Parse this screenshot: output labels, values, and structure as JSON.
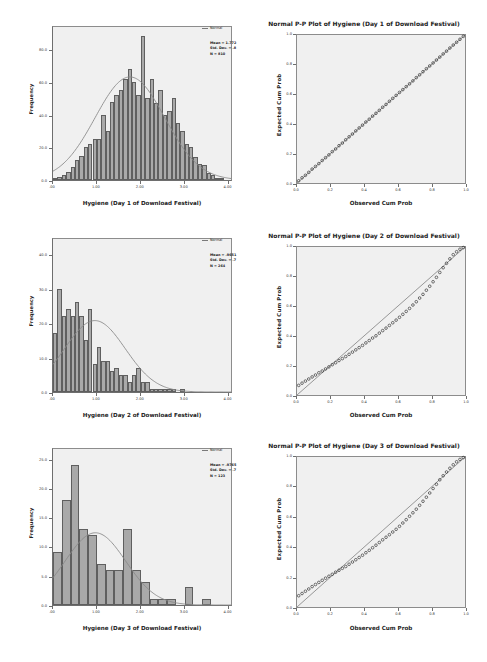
{
  "figure": {
    "background": "#ffffff",
    "panel_fill": "#f0f0f0",
    "bar_fill": "#a9a9a9",
    "bar_stroke": "#5f5f5f",
    "curve_color": "#8a8a8a",
    "point_color": "#1a1a1a",
    "reference_line_color": "#6e6e6e"
  },
  "panels": [
    {
      "id": "hist-day1",
      "legend_label": "Normal",
      "stats": {
        "mean": "Mean = 1.772",
        "std_dev": "Std. Dev. = .8",
        "n": "N = 810"
      },
      "chart_data": {
        "type": "bar",
        "title": "",
        "xlabel": "Hygiene (Day 1 of Download Festival)",
        "ylabel": "Frequency",
        "xlim": [
          0.0,
          4.1
        ],
        "ylim": [
          0,
          95
        ],
        "xticks": [
          ".00",
          "1.00",
          "2.00",
          "3.00",
          "4.00"
        ],
        "xtick_values": [
          0.0,
          1.0,
          2.0,
          3.0,
          4.0
        ],
        "yticks": [
          "0.0",
          "20.0",
          "40.0",
          "60.0",
          "80.0"
        ],
        "ytick_values": [
          0,
          20,
          40,
          60,
          80
        ],
        "grid": false,
        "bin_width": 0.1,
        "bins": [
          0.05,
          0.15,
          0.25,
          0.35,
          0.45,
          0.55,
          0.65,
          0.75,
          0.85,
          0.95,
          1.05,
          1.15,
          1.25,
          1.35,
          1.45,
          1.55,
          1.65,
          1.75,
          1.85,
          1.95,
          2.05,
          2.15,
          2.25,
          2.35,
          2.45,
          2.55,
          2.65,
          2.75,
          2.85,
          2.95,
          3.05,
          3.15,
          3.25,
          3.35,
          3.45,
          3.55,
          3.65,
          3.75,
          3.85
        ],
        "values": [
          1,
          2,
          3,
          5,
          8,
          12,
          15,
          20,
          22,
          25,
          25,
          40,
          30,
          48,
          52,
          55,
          62,
          68,
          60,
          52,
          88,
          50,
          62,
          47,
          55,
          40,
          42,
          50,
          35,
          30,
          22,
          20,
          14,
          10,
          9,
          4,
          3,
          1,
          1
        ],
        "overlay_curve": {
          "name": "Normal",
          "mean": 1.772,
          "sd": 0.8,
          "scale": 64
        }
      }
    },
    {
      "id": "pp-day1",
      "chart_data": {
        "type": "scatter",
        "title": "Normal P-P Plot of Hygiene (Day 1 of Download Festival)",
        "xlabel": "Observed Cum Prob",
        "ylabel": "Expected Cum Prob",
        "xlim": [
          0.0,
          1.0
        ],
        "ylim": [
          0.0,
          1.0
        ],
        "xticks": [
          "0.0",
          "0.2",
          "0.4",
          "0.6",
          "0.8",
          "1.0"
        ],
        "yticks": [
          "0.0",
          "0.2",
          "0.4",
          "0.6",
          "0.8",
          "1.0"
        ],
        "grid": false,
        "reference_line": [
          [
            0,
            0
          ],
          [
            1,
            1
          ]
        ],
        "x": [
          0.01,
          0.03,
          0.05,
          0.07,
          0.09,
          0.11,
          0.13,
          0.15,
          0.17,
          0.19,
          0.21,
          0.23,
          0.25,
          0.27,
          0.29,
          0.31,
          0.33,
          0.35,
          0.37,
          0.39,
          0.41,
          0.43,
          0.45,
          0.47,
          0.49,
          0.51,
          0.53,
          0.55,
          0.57,
          0.59,
          0.61,
          0.63,
          0.65,
          0.67,
          0.69,
          0.71,
          0.73,
          0.75,
          0.77,
          0.79,
          0.81,
          0.83,
          0.85,
          0.87,
          0.89,
          0.91,
          0.93,
          0.95,
          0.97,
          0.99
        ],
        "y": [
          0.015,
          0.035,
          0.052,
          0.072,
          0.094,
          0.112,
          0.131,
          0.152,
          0.171,
          0.19,
          0.212,
          0.23,
          0.252,
          0.27,
          0.292,
          0.312,
          0.331,
          0.352,
          0.372,
          0.391,
          0.412,
          0.431,
          0.452,
          0.471,
          0.491,
          0.512,
          0.531,
          0.552,
          0.572,
          0.592,
          0.612,
          0.631,
          0.651,
          0.67,
          0.69,
          0.712,
          0.731,
          0.752,
          0.772,
          0.791,
          0.811,
          0.831,
          0.851,
          0.872,
          0.891,
          0.912,
          0.932,
          0.951,
          0.971,
          0.991
        ]
      }
    },
    {
      "id": "hist-day2",
      "legend_label": "Normal",
      "stats": {
        "mean": "Mean = .9651",
        "std_dev": "Std. Dev. = .7",
        "n": "N = 264"
      },
      "chart_data": {
        "type": "bar",
        "title": "",
        "xlabel": "Hygiene (Day 2 of Download Festival)",
        "ylabel": "Frequency",
        "xlim": [
          0.0,
          4.1
        ],
        "ylim": [
          0,
          45
        ],
        "xticks": [
          ".00",
          "1.00",
          "2.00",
          "3.00",
          "4.00"
        ],
        "xtick_values": [
          0.0,
          1.0,
          2.0,
          3.0,
          4.0
        ],
        "yticks": [
          "0.0",
          "10.0",
          "20.0",
          "30.0",
          "40.0"
        ],
        "ytick_values": [
          0,
          10,
          20,
          30,
          40
        ],
        "grid": false,
        "bin_width": 0.1,
        "bins": [
          0.05,
          0.15,
          0.25,
          0.35,
          0.45,
          0.55,
          0.65,
          0.75,
          0.85,
          0.95,
          1.05,
          1.15,
          1.25,
          1.35,
          1.45,
          1.55,
          1.65,
          1.75,
          1.85,
          1.95,
          2.05,
          2.15,
          2.25,
          2.35,
          2.45,
          2.55,
          2.65,
          2.75,
          2.85,
          2.95,
          3.05,
          3.15,
          3.25,
          3.35,
          3.45,
          3.55
        ],
        "values": [
          17,
          30,
          22,
          24,
          22,
          26,
          22,
          15,
          24,
          8,
          13,
          9,
          9,
          6,
          7,
          5,
          5,
          3,
          5,
          7,
          3,
          3,
          1,
          1,
          1,
          1,
          1,
          1,
          0,
          1,
          0,
          0,
          0,
          0,
          0,
          0
        ],
        "overlay_curve": {
          "name": "Normal",
          "mean": 0.9651,
          "sd": 0.7,
          "scale": 21
        }
      }
    },
    {
      "id": "pp-day2",
      "chart_data": {
        "type": "scatter",
        "title": "Normal P-P Plot of Hygiene (Day 2 of Download Festival)",
        "xlabel": "Observed Cum Prob",
        "ylabel": "Expected Cum Prob",
        "xlim": [
          0.0,
          1.0
        ],
        "ylim": [
          0.0,
          1.0
        ],
        "xticks": [
          "0.0",
          "0.2",
          "0.4",
          "0.6",
          "0.8",
          "1.0"
        ],
        "yticks": [
          "0.0",
          "0.2",
          "0.4",
          "0.6",
          "0.8",
          "1.0"
        ],
        "grid": false,
        "reference_line": [
          [
            0,
            0
          ],
          [
            1,
            1
          ]
        ],
        "x": [
          0.01,
          0.03,
          0.05,
          0.07,
          0.09,
          0.11,
          0.13,
          0.15,
          0.17,
          0.19,
          0.21,
          0.23,
          0.25,
          0.27,
          0.29,
          0.31,
          0.33,
          0.35,
          0.37,
          0.39,
          0.41,
          0.43,
          0.45,
          0.47,
          0.49,
          0.51,
          0.53,
          0.55,
          0.57,
          0.59,
          0.61,
          0.63,
          0.65,
          0.67,
          0.69,
          0.71,
          0.73,
          0.75,
          0.77,
          0.79,
          0.81,
          0.83,
          0.85,
          0.87,
          0.89,
          0.91,
          0.93,
          0.95,
          0.97,
          0.99
        ],
        "y": [
          0.065,
          0.08,
          0.094,
          0.108,
          0.122,
          0.135,
          0.15,
          0.162,
          0.176,
          0.19,
          0.205,
          0.218,
          0.233,
          0.246,
          0.26,
          0.275,
          0.29,
          0.305,
          0.32,
          0.335,
          0.352,
          0.368,
          0.385,
          0.4,
          0.418,
          0.435,
          0.452,
          0.47,
          0.488,
          0.506,
          0.525,
          0.545,
          0.565,
          0.585,
          0.608,
          0.63,
          0.655,
          0.68,
          0.708,
          0.735,
          0.765,
          0.795,
          0.828,
          0.86,
          0.89,
          0.92,
          0.948,
          0.968,
          0.985,
          0.996
        ]
      }
    },
    {
      "id": "hist-day3",
      "legend_label": "Normal",
      "stats": {
        "mean": "Mean = .9765",
        "std_dev": "Std. Dev. = .7",
        "n": "N = 123"
      },
      "chart_data": {
        "type": "bar",
        "title": "",
        "xlabel": "Hygiene (Day 3 of Download Festival)",
        "ylabel": "Frequency",
        "xlim": [
          0.0,
          4.1
        ],
        "ylim": [
          0,
          27
        ],
        "xticks": [
          ".00",
          "1.00",
          "2.00",
          "3.00",
          "4.00"
        ],
        "xtick_values": [
          0.0,
          1.0,
          2.0,
          3.0,
          4.0
        ],
        "yticks": [
          "0.0",
          "5.0",
          "10.0",
          "15.0",
          "20.0",
          "25.0"
        ],
        "ytick_values": [
          0,
          5,
          10,
          15,
          20,
          25
        ],
        "grid": false,
        "bin_width": 0.2,
        "bins": [
          0.1,
          0.3,
          0.5,
          0.7,
          0.9,
          1.1,
          1.3,
          1.5,
          1.7,
          1.9,
          2.1,
          2.3,
          2.5,
          2.7,
          2.9,
          3.1,
          3.3,
          3.5,
          3.7
        ],
        "values": [
          9,
          18,
          24,
          13,
          12,
          7,
          6,
          6,
          13,
          6,
          4,
          1,
          1,
          1,
          0,
          3,
          0,
          1,
          0
        ],
        "overlay_curve": {
          "name": "Normal",
          "mean": 0.9765,
          "sd": 0.7,
          "scale": 12.5
        }
      }
    },
    {
      "id": "pp-day3",
      "chart_data": {
        "type": "scatter",
        "title": "Normal P-P Plot of Hygiene (Day 3 of Download Festival)",
        "xlabel": "Observed Cum Prob",
        "ylabel": "Expected Cum Prob",
        "xlim": [
          0.0,
          1.0
        ],
        "ylim": [
          0.0,
          1.0
        ],
        "xticks": [
          "0.0",
          "0.2",
          "0.4",
          "0.6",
          "0.8",
          "1.0"
        ],
        "yticks": [
          "0.0",
          "0.2",
          "0.4",
          "0.6",
          "0.8",
          "1.0"
        ],
        "grid": false,
        "reference_line": [
          [
            0,
            0
          ],
          [
            1,
            1
          ]
        ],
        "x": [
          0.01,
          0.03,
          0.05,
          0.07,
          0.09,
          0.11,
          0.13,
          0.15,
          0.17,
          0.19,
          0.21,
          0.23,
          0.25,
          0.27,
          0.29,
          0.31,
          0.33,
          0.35,
          0.37,
          0.39,
          0.41,
          0.43,
          0.45,
          0.47,
          0.49,
          0.51,
          0.53,
          0.55,
          0.57,
          0.59,
          0.61,
          0.63,
          0.65,
          0.67,
          0.69,
          0.71,
          0.73,
          0.75,
          0.77,
          0.79,
          0.81,
          0.83,
          0.85,
          0.87,
          0.89,
          0.91,
          0.93,
          0.95,
          0.97,
          0.99
        ],
        "y": [
          0.075,
          0.09,
          0.105,
          0.12,
          0.136,
          0.15,
          0.164,
          0.178,
          0.192,
          0.205,
          0.218,
          0.232,
          0.245,
          0.258,
          0.27,
          0.285,
          0.3,
          0.315,
          0.33,
          0.345,
          0.362,
          0.378,
          0.395,
          0.412,
          0.43,
          0.448,
          0.465,
          0.482,
          0.5,
          0.518,
          0.538,
          0.56,
          0.582,
          0.605,
          0.628,
          0.652,
          0.678,
          0.705,
          0.732,
          0.76,
          0.79,
          0.818,
          0.848,
          0.875,
          0.9,
          0.925,
          0.948,
          0.968,
          0.984,
          0.996
        ]
      }
    }
  ]
}
